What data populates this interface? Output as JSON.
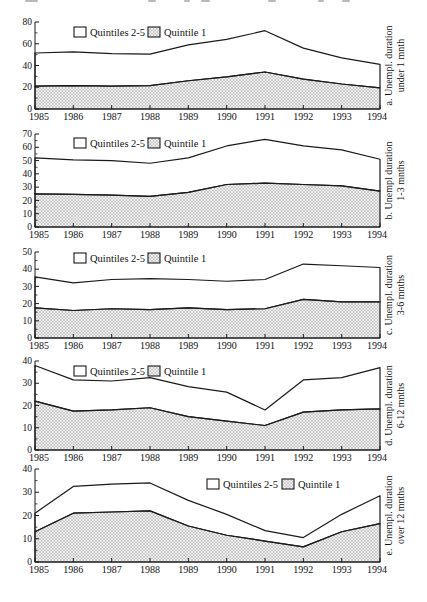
{
  "figure": {
    "description_visible_text_only": true,
    "colors": {
      "line": "#1a1a1a",
      "hatch": "#9b9b9b",
      "background": "#ffffff",
      "text": "#111111"
    }
  },
  "chart_data": [
    {
      "id": "a",
      "type": "area",
      "stack_note": "hatched area = Quintile 1 (0 to q1), white band = Quintiles 2-5 (q1 to total)",
      "x": [
        1985,
        1986,
        1987,
        1988,
        1989,
        1990,
        1991,
        1992,
        1993,
        1994
      ],
      "q1": [
        21,
        21.5,
        21,
        21.5,
        26,
        29.5,
        34,
        27.5,
        23,
        19.5
      ],
      "total": [
        51.5,
        52.5,
        51,
        50.5,
        59,
        64,
        72,
        56,
        47,
        41
      ],
      "ylim": [
        0,
        80
      ],
      "ytick_step": 20,
      "yminor_step": 10,
      "legend": [
        "Quintiles 2-5",
        "Quintile 1"
      ],
      "legend_position": "left",
      "right_label_lines": [
        "a. Unempl. duration",
        "under 1 mnth"
      ]
    },
    {
      "id": "b",
      "type": "area",
      "stack_note": "hatched area = Quintile 1, white band = Quintiles 2-5",
      "x": [
        1985,
        1986,
        1987,
        1988,
        1989,
        1990,
        1991,
        1992,
        1993,
        1994
      ],
      "q1": [
        25,
        24.5,
        24,
        23,
        26,
        32,
        33,
        32,
        31,
        27
      ],
      "total": [
        52,
        50.5,
        50,
        48,
        52,
        61,
        66,
        61,
        58,
        51
      ],
      "ylim": [
        0,
        70
      ],
      "ytick_step": 10,
      "yminor_step": 5,
      "legend": [
        "Quintiles 2-5",
        "Quintile 1"
      ],
      "legend_position": "left",
      "right_label_lines": [
        "b. Unempl duration",
        "1-3 mnths"
      ]
    },
    {
      "id": "c",
      "type": "area",
      "stack_note": "hatched area = Quintile 1, white band = Quintiles 2-5",
      "x": [
        1985,
        1986,
        1987,
        1988,
        1989,
        1990,
        1991,
        1992,
        1993,
        1994
      ],
      "q1": [
        17.5,
        16,
        17,
        16.5,
        17.5,
        16.5,
        17,
        22.5,
        21,
        21
      ],
      "total": [
        35.5,
        32,
        34,
        34.5,
        34,
        33,
        34,
        43,
        42,
        41
      ],
      "ylim": [
        0,
        50
      ],
      "ytick_step": 10,
      "yminor_step": 5,
      "legend": [
        "Quintiles 2-5",
        "Quintile 1"
      ],
      "legend_position": "left",
      "right_label_lines": [
        "c. Unempl. duration",
        "3-6 mnths"
      ]
    },
    {
      "id": "d",
      "type": "area",
      "stack_note": "hatched area = Quintile 1, white band = Quintiles 2-5",
      "x": [
        1985,
        1986,
        1987,
        1988,
        1989,
        1990,
        1991,
        1992,
        1993,
        1994
      ],
      "q1": [
        22,
        17.5,
        18,
        19,
        15,
        13,
        11,
        17,
        18,
        18.5
      ],
      "total": [
        38,
        31.5,
        31,
        32.5,
        28.5,
        26,
        18,
        31.5,
        32.5,
        37
      ],
      "ylim": [
        0,
        40
      ],
      "ytick_step": 10,
      "yminor_step": 5,
      "legend": [
        "Quintiles 2-5",
        "Quintile 1"
      ],
      "legend_position": "left",
      "right_label_lines": [
        "d. Unempl. duration",
        "6-12 mnths"
      ]
    },
    {
      "id": "e",
      "type": "area",
      "stack_note": "hatched area = Quintile 1, white band = Quintiles 2-5",
      "x": [
        1985,
        1986,
        1987,
        1988,
        1989,
        1990,
        1991,
        1992,
        1993,
        1994
      ],
      "q1": [
        13,
        21,
        21.5,
        22,
        15.5,
        11.5,
        9,
        6.5,
        13,
        16.5
      ],
      "total": [
        21,
        32.5,
        33.5,
        34,
        26.5,
        20.5,
        13.5,
        10.5,
        20.5,
        28.5
      ],
      "ylim": [
        0,
        40
      ],
      "ytick_step": 10,
      "yminor_step": 5,
      "legend": [
        "Quintiles 2-5",
        "Quintile 1"
      ],
      "legend_position": "right",
      "right_label_lines": [
        "e. Unempl. duration",
        "over 12 mnths"
      ]
    }
  ]
}
